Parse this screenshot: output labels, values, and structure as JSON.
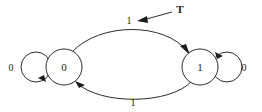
{
  "diagram": {
    "type": "finite-state-machine",
    "title": "",
    "background_color": "#ffffff",
    "stroke_color": "#2b2b2b",
    "text_color": "#1a1a1a",
    "states": [
      {
        "id": "state-0",
        "label": "0",
        "cx": 64,
        "cy": 67,
        "r": 18
      },
      {
        "id": "state-1",
        "label": "1",
        "cx": 200,
        "cy": 67,
        "r": 18
      }
    ],
    "self_loops": [
      {
        "id": "self-loop-left",
        "on_state": "state-0",
        "label": "0",
        "label_x": 11,
        "label_y": 71,
        "side": "left"
      },
      {
        "id": "self-loop-right",
        "on_state": "state-1",
        "label": "0",
        "label_x": 244,
        "label_y": 71,
        "side": "right"
      }
    ],
    "transitions": [
      {
        "id": "edge-top",
        "from": "state-0",
        "to": "state-1",
        "label": "1",
        "label_x": 129,
        "label_y": 24,
        "direction": "left-to-right",
        "curve": "arc-above"
      },
      {
        "id": "edge-bottom",
        "from": "state-1",
        "to": "state-0",
        "label": "1",
        "label_x": 133,
        "label_y": 106,
        "direction": "right-to-left",
        "curve": "arc-below"
      }
    ],
    "annotations": [
      {
        "id": "annotation-t",
        "label": "T",
        "label_x": 176,
        "label_y": 13,
        "points_to": "edge-top-label",
        "leader_from_x": 172,
        "leader_from_y": 12,
        "leader_to_x": 139,
        "leader_to_y": 21
      }
    ]
  }
}
